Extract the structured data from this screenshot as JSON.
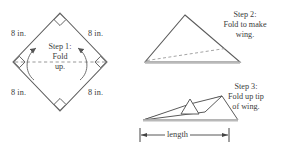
{
  "figure": {
    "stroke_color": "#555555",
    "text_color": "#3b3b3b",
    "fill_color": "#ffffff",
    "base_shade_color": "#bdbdbd",
    "background": "#ffffff"
  },
  "step1": {
    "caption_line1": "Step 1:",
    "caption_line2": "Fold",
    "caption_line3": "up.",
    "side_labels": {
      "top_left": "8 in.",
      "top_right": "8 in.",
      "bottom_left": "8 in.",
      "bottom_right": "8 in."
    },
    "shape": "square-rotated-45",
    "right_angle_markers": 4,
    "fold_line_style": "dashed-horizontal",
    "arrows": "two-curved-up"
  },
  "step2": {
    "caption_line1": "Step 2:",
    "caption_line2": "Fold to make",
    "caption_line3": "wing.",
    "shape": "triangle",
    "fold_line_style": "dashed-diagonal"
  },
  "step3": {
    "caption_line1": "Step 3:",
    "caption_line2": "Fold up tip",
    "caption_line3": "of wing.",
    "shape": "folded-wing-profile",
    "dimension_label": "length",
    "dimension_style": "double-headed-arrow"
  }
}
